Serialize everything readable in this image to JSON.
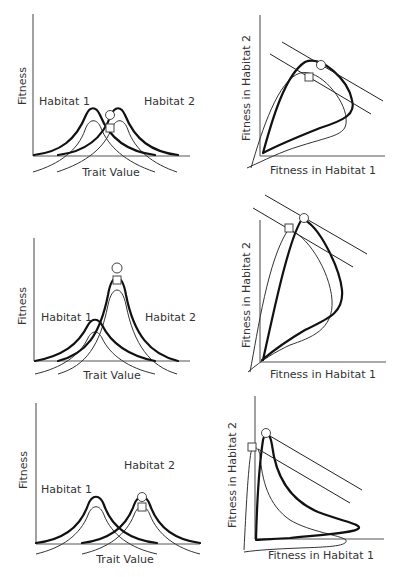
{
  "figure": {
    "rows": [
      {
        "trait_panel": {
          "ylabel": "Fitness",
          "xlabel": "Trait Value",
          "habitat1_label": "Habitat 1",
          "habitat2_label": "Habitat 2"
        },
        "fitness_panel": {
          "ylabel": "Fitness in Habitat 2",
          "xlabel": "Fitness in Habitat 1"
        }
      },
      {
        "trait_panel": {
          "ylabel": "Fitness",
          "xlabel": "Trait Value",
          "habitat1_label": "Habitat 1",
          "habitat2_label": "Habitat 2"
        },
        "fitness_panel": {
          "ylabel": "Fitness in Habitat 2",
          "xlabel": "Fitness in Habitat 1"
        }
      },
      {
        "trait_panel": {
          "ylabel": "Fitness",
          "xlabel": "Trait Value",
          "habitat1_label": "Habitat 1",
          "habitat2_label": "Habitat 2"
        },
        "fitness_panel": {
          "ylabel": "Fitness in Habitat 2",
          "xlabel": "Fitness in Habitat 1"
        }
      }
    ],
    "legend_markers": {
      "circle": "optimum-thick-curve",
      "square": "optimum-thin-curve"
    }
  }
}
